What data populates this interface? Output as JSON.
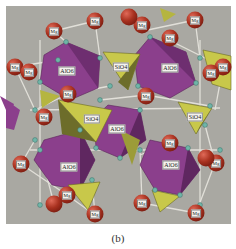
{
  "figure": {
    "caption": "(b)",
    "background_color": "#a9a8a2",
    "colors": {
      "AlO6_octahedron": "#8b3f8c",
      "SiO4_tetrahedron": "#c8c84a",
      "Mg_atom": "#a8311f",
      "O_atom": "#6fb5a8"
    },
    "labels": {
      "alo6": "AlO6",
      "sio4": "SiO4",
      "mg": "Mg"
    },
    "polyhedra": [
      {
        "type": "AlO6",
        "label": "AlO6",
        "x": 67,
        "y": 71
      },
      {
        "type": "AlO6",
        "label": "AlO6",
        "x": 170,
        "y": 68
      },
      {
        "type": "AlO6",
        "label": "AlO6",
        "x": 117,
        "y": 129
      },
      {
        "type": "AlO6",
        "label": "AlO6",
        "x": 69,
        "y": 167
      },
      {
        "type": "AlO6",
        "label": "AlO6",
        "x": 171,
        "y": 165
      },
      {
        "type": "SiO4",
        "label": "SiO4",
        "x": 121,
        "y": 67
      },
      {
        "type": "SiO4",
        "label": "SiO4",
        "x": 215,
        "y": 68
      },
      {
        "type": "SiO4",
        "label": "SiO4",
        "x": 92,
        "y": 118
      },
      {
        "type": "SiO4",
        "label": "SiO4",
        "x": 195,
        "y": 117
      },
      {
        "type": "SiO4",
        "label": "SiO4",
        "x": 92,
        "y": 119
      }
    ],
    "mg_atoms": [
      {
        "label": "Mg",
        "x": 54,
        "y": 31
      },
      {
        "label": "Mg",
        "x": 95,
        "y": 21
      },
      {
        "label": "Mg",
        "x": 15,
        "y": 67
      },
      {
        "label": "Mg",
        "x": 30,
        "y": 72
      },
      {
        "label": "Mg",
        "x": 68,
        "y": 94
      },
      {
        "label": "Mg",
        "x": 43,
        "y": 117
      },
      {
        "label": "Mg",
        "x": 143,
        "y": 31
      },
      {
        "label": "Mg",
        "x": 169,
        "y": 40
      },
      {
        "label": "Mg",
        "x": 195,
        "y": 20
      },
      {
        "label": "Mg",
        "x": 223,
        "y": 67
      },
      {
        "label": "Mg",
        "x": 211,
        "y": 73
      },
      {
        "label": "Mg",
        "x": 146,
        "y": 95
      },
      {
        "label": "Mg",
        "x": 170,
        "y": 143
      },
      {
        "label": "Mg",
        "x": 21,
        "y": 164
      },
      {
        "label": "Mg",
        "x": 67,
        "y": 195
      },
      {
        "label": "Mg",
        "x": 54,
        "y": 204
      },
      {
        "label": "Mg",
        "x": 95,
        "y": 215
      },
      {
        "label": "Mg",
        "x": 142,
        "y": 203
      },
      {
        "label": "Mg",
        "x": 196,
        "y": 213
      },
      {
        "label": "Mg",
        "x": 215,
        "y": 163
      },
      {
        "label": "Mg",
        "x": 205,
        "y": 158
      }
    ]
  }
}
